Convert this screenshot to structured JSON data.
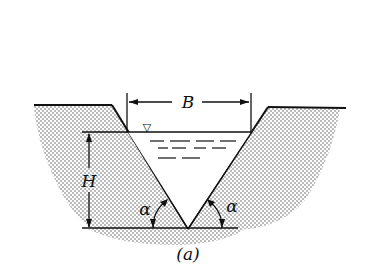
{
  "diagram": {
    "type": "cross-section",
    "labels": {
      "width": "B",
      "depth": "H",
      "left_angle": "α",
      "right_angle": "α",
      "caption": "(a)"
    },
    "symbols": {
      "water_surface_marker": "▽"
    },
    "colors": {
      "line": "#111111",
      "soil_dots": "#555555",
      "background": "#ffffff"
    }
  }
}
